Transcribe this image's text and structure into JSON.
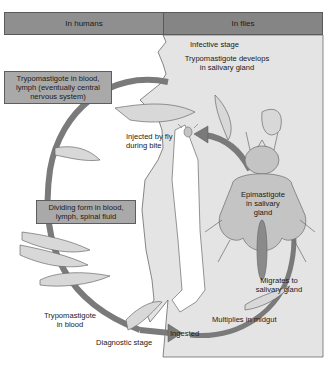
{
  "headers": {
    "humans": "In humans",
    "flies": "In flies"
  },
  "humans_stages": {
    "trypomastigote_cns": [
      "Trypomastigote in blood,",
      "lymph (eventually central",
      "nervous system)"
    ],
    "dividing_form": [
      "Dividing form in blood,",
      "lymph, spinal fluid"
    ],
    "trypomastigote_blood": [
      "Trypomastigote",
      "in blood"
    ],
    "diagnostic": "Diagnostic stage"
  },
  "flies_stages": {
    "infective": "Infective stage",
    "develops": [
      "Trypomastigote develops",
      "in salivary gland"
    ],
    "injected": [
      "Injected by fly",
      "during bite"
    ],
    "epimastigote": [
      "Epimastigote",
      "in salivary",
      "gland"
    ],
    "migrates": [
      "Migrates to",
      "salivary gland"
    ],
    "multiplies": "Multiplies in midgut",
    "ingested": "Ingested"
  },
  "colors": {
    "header_fill": "#8f8f8f",
    "box_fill": "#a9a9a9",
    "flies_panel": "#e4e4e4",
    "arrow": "#7a7a7a",
    "fly_body": "#c4c4c4"
  }
}
